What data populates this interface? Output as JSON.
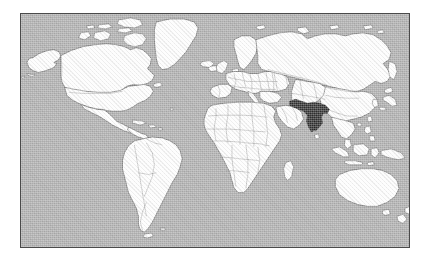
{
  "figure": {
    "type": "locator-map",
    "projection": "equirectangular",
    "frame": {
      "visible": true,
      "border_color": "#4a4a4a"
    }
  },
  "map": {
    "ocean_color": "#ababab",
    "land_color": "#fdfdfd",
    "coastline_color": "#3f3f3f",
    "country_border_color": "#7d7d7d",
    "highlight_color": "#2b2b2b",
    "highlighted_country": "India",
    "highlighted_region": "South Asia",
    "labels_visible": false,
    "graticule_visible": false
  },
  "regions": [
    {
      "id": "north-america",
      "name": "North America"
    },
    {
      "id": "greenland",
      "name": "Greenland"
    },
    {
      "id": "south-america",
      "name": "South America"
    },
    {
      "id": "europe",
      "name": "Europe"
    },
    {
      "id": "africa",
      "name": "Africa"
    },
    {
      "id": "asia",
      "name": "Asia"
    },
    {
      "id": "india",
      "name": "India"
    },
    {
      "id": "southeast-asia",
      "name": "Southeast Asia"
    },
    {
      "id": "australia",
      "name": "Australia"
    },
    {
      "id": "new-zealand",
      "name": "New Zealand"
    },
    {
      "id": "japan",
      "name": "Japan"
    },
    {
      "id": "iceland",
      "name": "Iceland"
    },
    {
      "id": "madagascar",
      "name": "Madagascar"
    },
    {
      "id": "british-isles",
      "name": "British Isles"
    }
  ]
}
